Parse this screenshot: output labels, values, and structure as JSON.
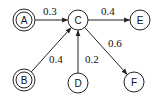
{
  "diagram": {
    "type": "directed-graph",
    "nodes": [
      {
        "id": "A",
        "label": "A",
        "x": 24,
        "y": 20,
        "double": true
      },
      {
        "id": "C",
        "label": "C",
        "x": 78,
        "y": 20,
        "double": false
      },
      {
        "id": "E",
        "label": "E",
        "x": 140,
        "y": 20,
        "double": false
      },
      {
        "id": "B",
        "label": "B",
        "x": 24,
        "y": 80,
        "double": true
      },
      {
        "id": "D",
        "label": "D",
        "x": 78,
        "y": 83,
        "double": false
      },
      {
        "id": "F",
        "label": "F",
        "x": 134,
        "y": 82,
        "double": false
      }
    ],
    "edges": [
      {
        "from": "A",
        "to": "C",
        "weight": "0.3",
        "label_x": 43,
        "label_y": 15
      },
      {
        "from": "C",
        "to": "E",
        "weight": "0.4",
        "label_x": 101,
        "label_y": 15
      },
      {
        "from": "B",
        "to": "C",
        "weight": "0.4",
        "label_x": 49,
        "label_y": 63
      },
      {
        "from": "D",
        "to": "C",
        "weight": "0.2",
        "label_x": 85,
        "label_y": 63
      },
      {
        "from": "C",
        "to": "F",
        "weight": "0.6",
        "label_x": 108,
        "label_y": 47
      }
    ],
    "colors": {
      "stroke": "#222222",
      "text": "#111111",
      "background": "#ffffff"
    }
  }
}
